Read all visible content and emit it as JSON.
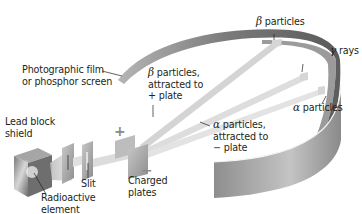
{
  "diagram": {
    "components": {
      "lead_block": {
        "label_line1": "Lead block",
        "label_line2": "shield"
      },
      "radioactive_element": {
        "label_line1": "Radioactive",
        "label_line2": "element"
      },
      "slit": {
        "label": "Slit"
      },
      "charged_plates": {
        "label_line1": "Charged",
        "label_line2": "plates",
        "positive_sign": "+",
        "negative_sign": "−"
      },
      "screen": {
        "label_line1": "Photographic film",
        "label_line2": "or phosphor screen"
      }
    },
    "beams": {
      "beta_attracted": {
        "symbol": "β",
        "label_line1": " particles,",
        "label_line2": "attracted to",
        "label_line3": "+ plate"
      },
      "alpha_attracted": {
        "symbol": "α",
        "label_line1": " particles,",
        "label_line2": "attracted to",
        "label_line3": "− plate"
      }
    },
    "screen_hits": {
      "beta": {
        "symbol": "β",
        "label": " particles"
      },
      "gamma": {
        "symbol": "γ",
        "label": " rays"
      },
      "alpha": {
        "symbol": "α",
        "label": " particles"
      }
    },
    "colors": {
      "screen_outer": "#9a9a9a",
      "screen_inner": "#6e6e6e",
      "screen_light": "#cfcfcf",
      "beam": "#d9d9d9",
      "block": "#8c8c8c",
      "plate": "#a8a8a8"
    }
  }
}
